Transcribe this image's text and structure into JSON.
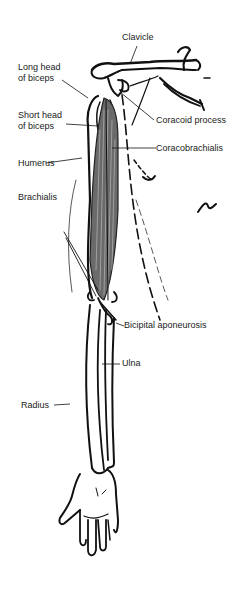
{
  "diagram": {
    "labels": {
      "clavicle": "Clavicle",
      "long_head_line1": "Long head",
      "long_head_line2": "of biceps",
      "short_head_line1": "Short head",
      "short_head_line2": "of biceps",
      "coracoid_process": "Coracoid process",
      "humerus": "Humerus",
      "coracobrachialis": "Coracobrachialis",
      "brachialis": "Brachialis",
      "bicipital_aponeurosis": "Bicipital aponeurosis",
      "ulna": "Ulna",
      "radius": "Radius"
    },
    "colors": {
      "line": "#111111",
      "muscle_fill": "#6a6a6a",
      "background": "#ffffff"
    }
  }
}
